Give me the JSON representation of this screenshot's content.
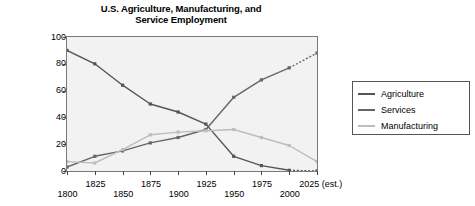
{
  "chart_data": {
    "type": "line",
    "title": "U.S. Agriculture, Manufacturing, and Service Employment",
    "title_line1": "U.S. Agriculture, Manufacturing, and",
    "title_line2": "Service Employment",
    "xlabel": "",
    "ylabel": "Percent of workforce",
    "xlim": [
      1800,
      2025
    ],
    "ylim": [
      0,
      100
    ],
    "grid": false,
    "legend_position": "right",
    "x": [
      1800,
      1825,
      1850,
      1875,
      1900,
      1925,
      1950,
      1975,
      2000,
      2025
    ],
    "xtick_labels": [
      "1800",
      "1825",
      "1850",
      "1875",
      "1900",
      "1925",
      "1950",
      "1975",
      "2000",
      "2025 (est.)"
    ],
    "ytick_labels": [
      "0",
      "20",
      "40",
      "60",
      "80",
      "100"
    ],
    "ytick_values": [
      0,
      20,
      40,
      60,
      80,
      100
    ],
    "series": [
      {
        "name": "Agriculture",
        "color": "#555555",
        "values": [
          90,
          80,
          64,
          50,
          44,
          35,
          11,
          4,
          0.5,
          0
        ],
        "dashed_from": 2000
      },
      {
        "name": "Services",
        "color": "#666666",
        "values": [
          3,
          11,
          15,
          21,
          25,
          31,
          55,
          68,
          77,
          88
        ],
        "dashed_from": 2000
      },
      {
        "name": "Manufacturing",
        "color": "#bdbdbd",
        "values": [
          7,
          6,
          16,
          27,
          29,
          30,
          31,
          25,
          19,
          7
        ],
        "dashed_from": null
      }
    ]
  },
  "legend": {
    "items": [
      {
        "label": "Agriculture"
      },
      {
        "label": "Services"
      },
      {
        "label": "Manufacturing"
      }
    ]
  },
  "colors": {
    "agriculture": "#555555",
    "services": "#666666",
    "manufacturing": "#bdbdbd",
    "plot_background": "#f2f2f2",
    "axis": "#7a7a7a",
    "text": "#000000"
  }
}
